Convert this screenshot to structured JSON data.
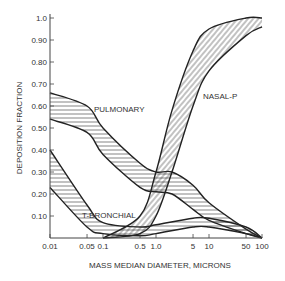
{
  "chart_data": {
    "type": "area",
    "title": "",
    "xlabel": "MASS MEDIAN DIAMETER, MICRONS",
    "ylabel": "DEPOSITION FRACTION",
    "xscale": "log",
    "xlim": [
      0.01,
      100
    ],
    "ylim": [
      0,
      1.0
    ],
    "x_ticks": [
      "0.01",
      "0.05",
      "0.1",
      "0.5",
      "1.0",
      "5",
      "10",
      "50",
      "100"
    ],
    "x_tick_values": [
      0.01,
      0.05,
      0.1,
      0.5,
      1.0,
      5,
      10,
      50,
      100
    ],
    "y_ticks": [
      "0.10",
      "0.20",
      "0.30",
      "0.40",
      "0.50",
      "0.60",
      "0.70",
      "0.80",
      "0.90",
      "1.0"
    ],
    "y_tick_values": [
      0.1,
      0.2,
      0.3,
      0.4,
      0.5,
      0.6,
      0.7,
      0.8,
      0.9,
      1.0
    ],
    "grid": false,
    "series": [
      {
        "name": "PULMONARY",
        "x": [
          0.01,
          0.05,
          0.1,
          0.5,
          1.0,
          2,
          5,
          10,
          50,
          100
        ],
        "upper": [
          0.66,
          0.6,
          0.5,
          0.34,
          0.3,
          0.3,
          0.24,
          0.16,
          0.04,
          0.0
        ],
        "lower": [
          0.54,
          0.48,
          0.38,
          0.23,
          0.21,
          0.2,
          0.13,
          0.08,
          0.02,
          0.0
        ]
      },
      {
        "name": "T-BRONCHIAL",
        "x": [
          0.01,
          0.05,
          0.1,
          0.5,
          1.0,
          5,
          10,
          50,
          100
        ],
        "upper": [
          0.4,
          0.15,
          0.07,
          0.05,
          0.06,
          0.09,
          0.09,
          0.05,
          0.0
        ],
        "lower": [
          0.23,
          0.05,
          0.02,
          0.01,
          0.02,
          0.05,
          0.05,
          0.02,
          0.0
        ]
      },
      {
        "name": "NASAL-P",
        "x": [
          0.1,
          0.5,
          1.0,
          2,
          5,
          10,
          50,
          100
        ],
        "upper": [
          0.0,
          0.1,
          0.3,
          0.58,
          0.85,
          0.95,
          1.0,
          1.0
        ],
        "lower": [
          0.0,
          0.02,
          0.1,
          0.3,
          0.6,
          0.76,
          0.92,
          0.96
        ]
      }
    ],
    "annotations": [
      "PULMONARY",
      "T-BRONCHIAL",
      "NASAL-P"
    ]
  }
}
